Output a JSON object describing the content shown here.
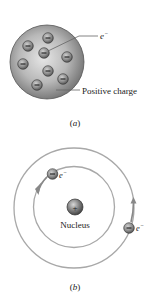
{
  "figure_a": {
    "electron_label": "e",
    "electron_sup": "−",
    "positive_charge_label": "Positive charge",
    "caption_open": "(",
    "caption_letter": "a",
    "caption_close": ")",
    "electron_count": 8,
    "electron_symbol": "−"
  },
  "figure_b": {
    "nucleus_label": "Nucleus",
    "nucleus_symbol": "+",
    "electron_label_1": "e",
    "electron_sup_1": "−",
    "electron_label_2": "e",
    "electron_sup_2": "−",
    "electron_symbol": "−",
    "caption_open": "(",
    "caption_letter": "b",
    "caption_close": ")"
  },
  "colors": {
    "sphere": "#9a9a9a",
    "electron": "#7a7a7a",
    "orbit": "#a8a8a8",
    "text": "#222222"
  }
}
